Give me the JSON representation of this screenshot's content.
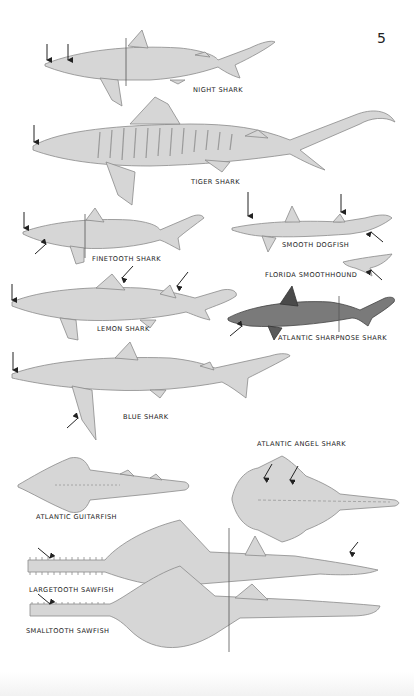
{
  "page": {
    "number": "5",
    "colors": {
      "body": "#d6d6d6",
      "outline": "#8a8a8a",
      "ink": "#222222",
      "dark_shark": "#6d6d6d"
    }
  },
  "species": [
    {
      "id": "night-shark",
      "label": "NIGHT SHARK",
      "arrows": 2
    },
    {
      "id": "tiger-shark",
      "label": "TIGER SHARK",
      "arrows": 1
    },
    {
      "id": "finetooth-shark",
      "label": "FINETOOTH SHARK",
      "arrows": 2
    },
    {
      "id": "smooth-dogfish",
      "label": "SMOOTH DOGFISH",
      "arrows": 3
    },
    {
      "id": "florida-smoothhound",
      "label": "FLORIDA SMOOTHHOUND",
      "arrows": 1
    },
    {
      "id": "lemon-shark",
      "label": "LEMON SHARK",
      "arrows": 3
    },
    {
      "id": "atlantic-sharpnose-shark",
      "label": "ATLANTIC SHARPNOSE SHARK",
      "arrows": 1
    },
    {
      "id": "blue-shark",
      "label": "BLUE SHARK",
      "arrows": 2
    },
    {
      "id": "atlantic-angel-shark",
      "label": "ATLANTIC ANGEL SHARK",
      "arrows": 2
    },
    {
      "id": "atlantic-guitarfish",
      "label": "ATLANTIC GUITARFISH",
      "arrows": 0
    },
    {
      "id": "largetooth-sawfish",
      "label": "LARGETOOTH SAWFISH",
      "arrows": 2
    },
    {
      "id": "smalltooth-sawfish",
      "label": "SMALLTOOTH SAWFISH",
      "arrows": 1
    }
  ]
}
